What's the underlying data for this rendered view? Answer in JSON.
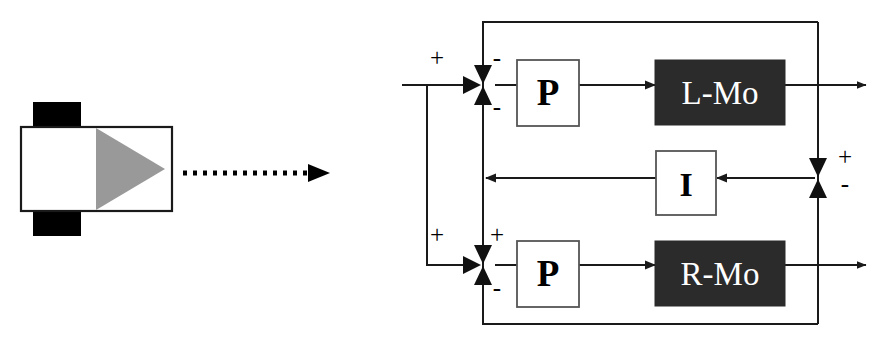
{
  "diagram": {
    "left_panel": {
      "robot_icon": {
        "name": "mobile-robot-icon",
        "body_fill": "#ffffff",
        "body_stroke": "#000000",
        "wheel_fill": "#000000",
        "heading_triangle_fill": "#999999"
      },
      "motion_arrow": {
        "name": "dotted-motion-arrow",
        "style": "dotted",
        "color": "#000000",
        "direction": "right"
      }
    },
    "blocks": [
      {
        "id": "p-top",
        "label": "P",
        "fill": "#ffffff",
        "text_color": "#000000"
      },
      {
        "id": "l-mo",
        "label": "L-Mo",
        "fill": "#2b2b2b",
        "text_color": "#ffffff"
      },
      {
        "id": "i-mid",
        "label": "I",
        "fill": "#ffffff",
        "text_color": "#000000"
      },
      {
        "id": "p-bot",
        "label": "P",
        "fill": "#ffffff",
        "text_color": "#000000"
      },
      {
        "id": "r-mo",
        "label": "R-Mo",
        "fill": "#2b2b2b",
        "text_color": "#ffffff"
      }
    ],
    "signs": {
      "top_junction_plus": "+",
      "top_junction_minus_upper": "-",
      "top_junction_minus_lower": "-",
      "bottom_junction_plus_left": "+",
      "bottom_junction_plus_right": "+",
      "bottom_junction_minus": "-",
      "right_junction_plus": "+",
      "right_junction_minus": "-"
    },
    "colors": {
      "line": "#1a1a1a",
      "dark_block": "#2b2b2b",
      "light_block": "#ffffff",
      "triangle_gray": "#999999",
      "background": "#ffffff"
    }
  }
}
